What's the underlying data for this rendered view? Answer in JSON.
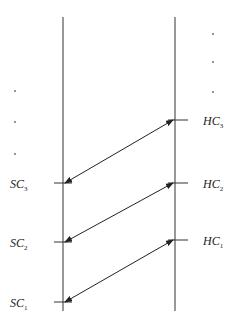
{
  "diagram": {
    "left_labels": [
      {
        "main": "SC",
        "sub": "3"
      },
      {
        "main": "SC",
        "sub": "2"
      },
      {
        "main": "SC",
        "sub": "1"
      }
    ],
    "right_labels": [
      {
        "main": "HC",
        "sub": "3"
      },
      {
        "main": "HC",
        "sub": "2"
      },
      {
        "main": "HC",
        "sub": "1"
      }
    ],
    "connections": [
      {
        "from": "SC1",
        "to": "HC1",
        "double_headed": true
      },
      {
        "from": "SC2",
        "to": "HC2",
        "double_headed": true
      },
      {
        "from": "SC3",
        "to": "HC3",
        "double_headed": true
      }
    ],
    "continuation_marker": "⋮",
    "colors": {
      "line": "#333333",
      "arrow": "#222222",
      "text": "#222222"
    }
  }
}
